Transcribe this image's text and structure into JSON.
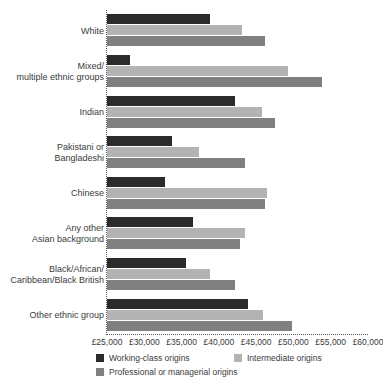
{
  "chart_data": {
    "type": "bar",
    "orientation": "horizontal",
    "title": "",
    "xlabel": "",
    "ylabel": "",
    "xlim": [
      25000,
      60000
    ],
    "xticks": [
      25000,
      30000,
      35000,
      40000,
      45000,
      50000,
      55000,
      60000
    ],
    "xtick_labels": [
      "£25,000",
      "£30,000",
      "£35,000",
      "£40,000",
      "£45,000",
      "£50,000",
      "£55,000",
      "£60,000"
    ],
    "grid": false,
    "legend_position": "bottom",
    "categories": [
      "White",
      "Mixed/\nmultiple ethnic groups",
      "Indian",
      "Pakistani or\nBangladeshi",
      "Chinese",
      "Any other\nAsian background",
      "Black/African/\nCaribbean/Black British",
      "Other ethnic group"
    ],
    "series": [
      {
        "name": "Working-class origins",
        "color": "#2b2b2b",
        "values": [
          38800,
          28100,
          42200,
          33700,
          32800,
          36500,
          35600,
          43900
        ]
      },
      {
        "name": "Intermediate origins",
        "color": "#b3b3b3",
        "values": [
          43100,
          49300,
          45800,
          37400,
          46400,
          43500,
          38800,
          45900
        ]
      },
      {
        "name": "Professional or managerial origins",
        "color": "#808080",
        "values": [
          46200,
          53800,
          47500,
          43500,
          46200,
          42800,
          42200,
          49800
        ]
      }
    ]
  },
  "legend": {
    "items": [
      {
        "label": "Working-class origins",
        "swatch": "s0"
      },
      {
        "label": "Intermediate origins",
        "swatch": "s1"
      },
      {
        "label": "Professional or managerial origins",
        "swatch": "s2"
      }
    ]
  },
  "colors": {
    "working_class": "#2b2b2b",
    "intermediate": "#b3b3b3",
    "professional": "#808080",
    "axis": "#5a5a5a",
    "text": "#3a3a3a",
    "background": "#ffffff"
  }
}
